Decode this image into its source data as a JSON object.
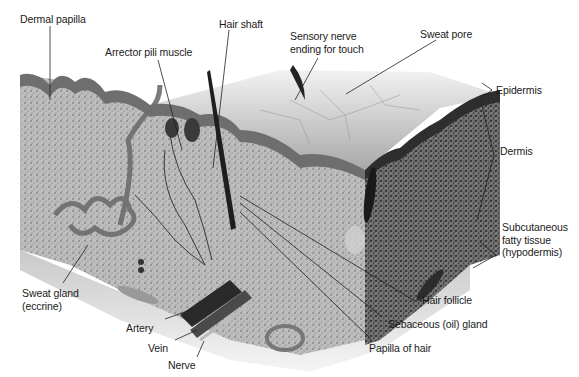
{
  "labels": {
    "dermal_papilla": "Dermal papilla",
    "hair_shaft": "Hair shaft",
    "sensory_nerve": "Sensory nerve\nending for touch",
    "sweat_pore": "Sweat pore",
    "arrector_pili": "Arrector pili muscle",
    "epidermis": "Epidermis",
    "dermis": "Dermis",
    "subcutaneous": "Subcutaneous\nfatty tissue\n(hypodermis)",
    "sweat_gland": "Sweat gland\n(eccrine)",
    "hair_follicle": "Hair follicle",
    "sebaceous_gland": "Sebaceous (oil) gland",
    "papilla_of_hair": "Papilla of hair",
    "artery": "Artery",
    "vein": "Vein",
    "nerve": "Nerve"
  },
  "colors": {
    "label_text": "#1a1a1a",
    "leader_line": "#222222",
    "epidermis": "#6a6a6a",
    "dermis": "#b8b8b8",
    "dermis_dark": "#4a4a4a",
    "hypodermis": "#d6d6d6",
    "surface": "#a9a9a9"
  }
}
